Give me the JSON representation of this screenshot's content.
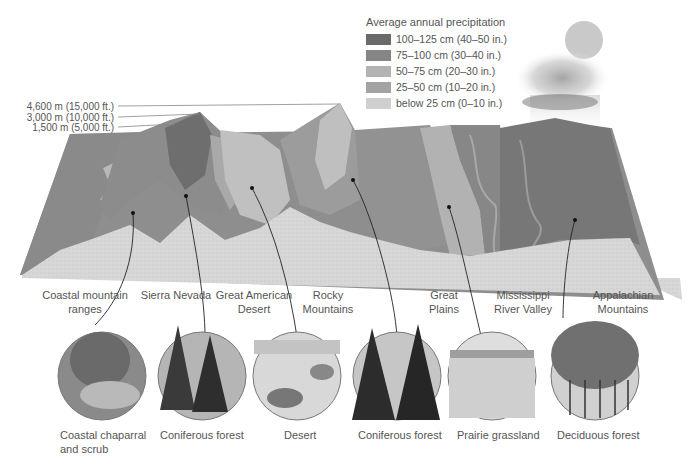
{
  "legend": {
    "title": "Average annual precipitation",
    "items": [
      {
        "label": "100–125 cm (40–50 in.)",
        "color": "#6a6a6a"
      },
      {
        "label": "75–100 cm (30–40 in.)",
        "color": "#858585"
      },
      {
        "label": "50–75 cm (20–30 in.)",
        "color": "#b3b3b3"
      },
      {
        "label": "25–50 cm (10–20 in.)",
        "color": "#a3a3a3"
      },
      {
        "label": "below 25 cm (0–10 in.)",
        "color": "#cfcfcf"
      }
    ]
  },
  "elevations": [
    {
      "label": "4,600 m (15,000 ft.)"
    },
    {
      "label": "3,000 m (10,000 ft.)"
    },
    {
      "label": "1,500 m (5,000 ft.)"
    }
  ],
  "regions": [
    {
      "line1": "Coastal mountain",
      "line2": "ranges"
    },
    {
      "line1": "Sierra Nevada",
      "line2": ""
    },
    {
      "line1": "Great American",
      "line2": "Desert"
    },
    {
      "line1": "Rocky",
      "line2": "Mountains"
    },
    {
      "line1": "Great",
      "line2": "Plains"
    },
    {
      "line1": "Mississippi",
      "line2": "River Valley"
    },
    {
      "line1": "Appalachian",
      "line2": "Mountains"
    }
  ],
  "biomes": [
    {
      "line1": "Coastal chaparral",
      "line2": "and scrub"
    },
    {
      "line1": "Coniferous forest",
      "line2": ""
    },
    {
      "line1": "Desert",
      "line2": ""
    },
    {
      "line1": "Coniferous forest",
      "line2": ""
    },
    {
      "line1": "Prairie grassland",
      "line2": ""
    },
    {
      "line1": "Deciduous forest",
      "line2": ""
    }
  ]
}
